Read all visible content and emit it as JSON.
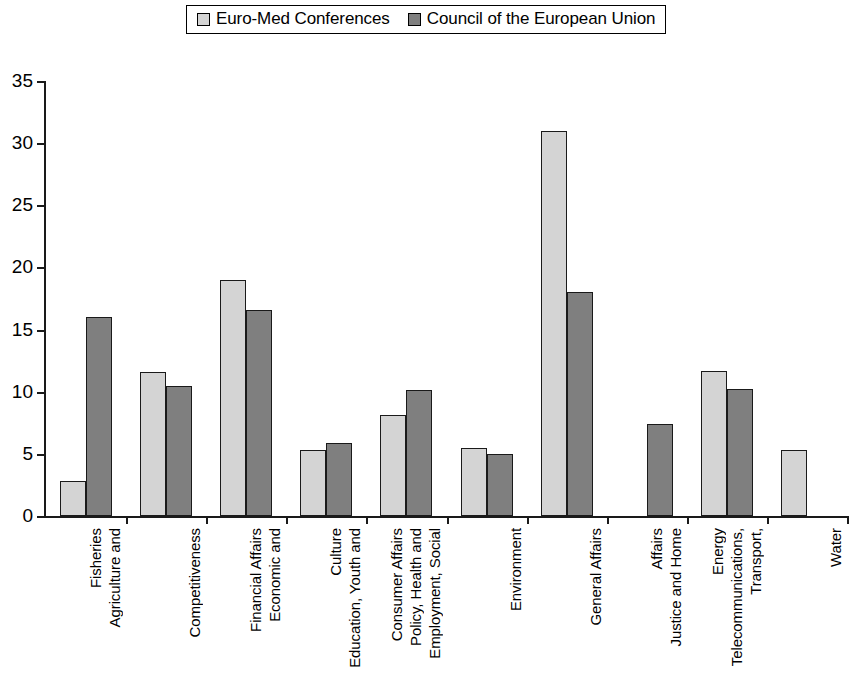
{
  "legend": {
    "position": "top-center",
    "entries": [
      {
        "label": "Euro-Med Conferences",
        "color": "#d4d4d4",
        "swatch": "light"
      },
      {
        "label": "Council of the European Union",
        "color": "#7f7f7f",
        "swatch": "dark"
      }
    ]
  },
  "axis": {
    "y_ticks": [
      "0",
      "5",
      "10",
      "15",
      "20",
      "25",
      "30",
      "35"
    ]
  },
  "chart_data": {
    "type": "bar",
    "title": "",
    "subtitle": "",
    "xlabel": "",
    "ylabel": "",
    "ylim": [
      0,
      35
    ],
    "ytick_values": [
      0,
      5,
      10,
      15,
      20,
      25,
      30,
      35
    ],
    "grid": false,
    "legend_position": "top-center",
    "categories": [
      "Agriculture and Fisheries",
      "Competitiveness",
      "Economic and Financial Affairs",
      "Education, Youth and Culture",
      "Employment, Social Policy, Health and Consumer Affairs",
      "Environment",
      "General Affairs",
      "Justice and Home Affairs",
      "Transport, Telecommunications, Energy",
      "Water"
    ],
    "category_label_lines": [
      [
        "Agriculture and",
        "Fisheries"
      ],
      [
        "Competitiveness"
      ],
      [
        "Economic and",
        "Financial Affairs"
      ],
      [
        "Education, Youth and",
        "Culture"
      ],
      [
        "Employment, Social",
        "Policy, Health and",
        "Consumer Affairs"
      ],
      [
        "Environment"
      ],
      [
        "General Affairs"
      ],
      [
        "Justice and Home",
        "Affairs"
      ],
      [
        "Transport,",
        "Telecommunications,",
        "Energy"
      ],
      [
        "Water"
      ]
    ],
    "series": [
      {
        "name": "Euro-Med Conferences",
        "color": "#d4d4d4",
        "values": [
          2.8,
          11.6,
          19.0,
          5.3,
          8.1,
          5.5,
          31.0,
          null,
          11.7,
          5.3
        ]
      },
      {
        "name": "Council of the European Union",
        "color": "#7f7f7f",
        "values": [
          16.0,
          10.5,
          16.6,
          5.9,
          10.1,
          5.0,
          18.0,
          7.4,
          10.2,
          null
        ]
      }
    ]
  }
}
